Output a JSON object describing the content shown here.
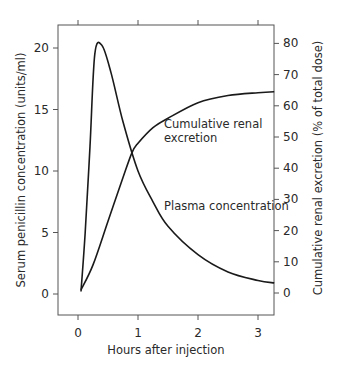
{
  "chart_data": {
    "type": "line",
    "title": "",
    "xlabel": "Hours after injection",
    "ylabel": "Serum penicillin concentration (units/ml)",
    "y2label": "Cumulative renal excretion (% of total dose)",
    "xlim": [
      -0.33,
      3.27
    ],
    "ylim": [
      -1.7,
      21.5
    ],
    "y2lim": [
      -7,
      80
    ],
    "x_ticks": [
      "0",
      "1",
      "2",
      "3"
    ],
    "y_ticks": [
      "0",
      "5",
      "10",
      "15",
      "20"
    ],
    "y2_ticks": [
      "0",
      "10",
      "20",
      "30",
      "40",
      "50",
      "60",
      "70",
      "80"
    ],
    "grid": false,
    "legend": "none (inline annotations)",
    "series": [
      {
        "name": "Plasma concentration",
        "axis": "left",
        "x": [
          0.05,
          0.12,
          0.2,
          0.28,
          0.4,
          0.55,
          0.75,
          1.0,
          1.25,
          1.5,
          2.0,
          2.5,
          3.0,
          3.27
        ],
        "values": [
          0.2,
          5,
          12,
          19.5,
          20.2,
          18,
          14,
          10,
          7.5,
          5.5,
          3.2,
          1.8,
          1.1,
          0.9
        ]
      },
      {
        "name": "Cumulative renal excretion",
        "axis": "right",
        "x": [
          0.05,
          0.25,
          0.5,
          0.75,
          0.9,
          1.0,
          1.25,
          1.5,
          2.0,
          2.5,
          3.0,
          3.27
        ],
        "values": [
          1,
          9,
          23,
          37,
          45,
          48,
          53,
          56,
          61,
          63.3,
          64.2,
          64.5
        ]
      }
    ],
    "annotations": [
      {
        "text_line1": "Cumulative renal",
        "text_line2": "excretion"
      },
      {
        "text": "Plasma concentration"
      }
    ]
  },
  "labels": {
    "xlabel": "Hours after injection",
    "ylabel": "Serum penicillin concentration (units/ml)",
    "y2label": "Cumulative renal excretion (% of total dose)",
    "annot_renal_1": "Cumulative renal",
    "annot_renal_2": "excretion",
    "annot_plasma": "Plasma concentration"
  },
  "colors": {
    "curve": "#1a1a1a",
    "axis": "#555555",
    "text": "#2a2a2a",
    "background": "#ffffff"
  }
}
